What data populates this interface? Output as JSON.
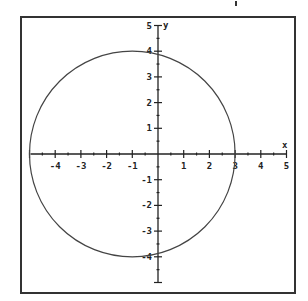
{
  "chart_data": {
    "type": "line",
    "title": "",
    "xlabel": "x",
    "ylabel": "y",
    "xlim": [
      -5,
      5
    ],
    "ylim": [
      -5,
      5
    ],
    "grid": false,
    "x_ticks": [
      -4,
      -3,
      -2,
      -1,
      1,
      2,
      3,
      4,
      5
    ],
    "y_ticks": [
      5,
      4,
      3,
      2,
      1,
      -1,
      -2,
      -3,
      -4
    ],
    "series": [
      {
        "name": "circle",
        "shape": "circle",
        "center": [
          -1,
          0
        ],
        "radius": 4,
        "equation": "(x+1)^2 + y^2 = 16",
        "key_points": [
          [
            -5,
            0
          ],
          [
            3,
            0
          ],
          [
            -1,
            4
          ],
          [
            -1,
            -4
          ],
          [
            0,
            3.87
          ],
          [
            0,
            -3.87
          ]
        ]
      }
    ]
  },
  "colors": {
    "background": "#ffffff",
    "frame": "#333333",
    "axes": "#222222",
    "curve": "#444444"
  }
}
